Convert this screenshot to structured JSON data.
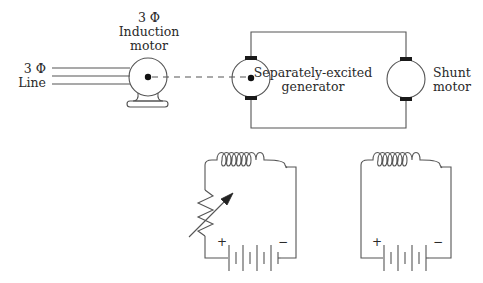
{
  "diagram": {
    "title": "",
    "labels": {
      "line": {
        "line1": "3 Φ",
        "line2": "Line"
      },
      "induction_motor": {
        "line1": "3 Φ",
        "line2": "Induction",
        "line3": "motor"
      },
      "generator": {
        "line1": "Separately-excited",
        "line2": "generator"
      },
      "shunt_motor": {
        "line1": "Shunt",
        "line2": "motor"
      },
      "left_battery": {
        "plus": "+",
        "minus": "−"
      },
      "right_battery": {
        "plus": "+",
        "minus": "−"
      }
    },
    "components": [
      {
        "id": "three-phase-line",
        "type": "three-wire supply",
        "label": "3 Φ Line"
      },
      {
        "id": "induction-motor",
        "type": "AC motor",
        "label": "3 Φ Induction motor"
      },
      {
        "id": "mechanical-coupling",
        "type": "shaft (dashed)",
        "connects": [
          "induction-motor",
          "generator"
        ]
      },
      {
        "id": "generator",
        "type": "DC machine",
        "label": "Separately-excited generator"
      },
      {
        "id": "shunt-motor",
        "type": "DC machine",
        "label": "Shunt motor"
      },
      {
        "id": "generator-field",
        "type": "field coil with rheostat and battery"
      },
      {
        "id": "motor-field",
        "type": "field coil with battery"
      }
    ],
    "colors": {
      "stroke": "#555555",
      "text": "#2a2a2a",
      "background": "#ffffff",
      "brush": "#1a1a1a"
    }
  }
}
